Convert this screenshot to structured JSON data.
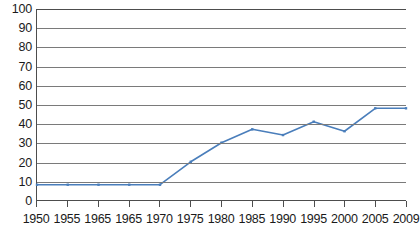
{
  "chart_data": {
    "type": "line",
    "title": "",
    "subtitle": "",
    "xlabel": "",
    "ylabel": "",
    "ylim": [
      0,
      100
    ],
    "ytick_step": 10,
    "yticks": [
      0,
      10,
      20,
      30,
      40,
      50,
      60,
      70,
      80,
      90,
      100
    ],
    "grid": true,
    "legend": false,
    "legend_position": "none",
    "categories": [
      "1950",
      "1955",
      "1965",
      "1965",
      "1970",
      "1975",
      "1980",
      "1985",
      "1990",
      "1995",
      "2000",
      "2005",
      "2009"
    ],
    "series": [
      {
        "name": "series-1",
        "color": "#4a7ebb",
        "values": [
          8,
          8,
          8,
          8,
          8,
          20,
          30,
          37,
          34,
          41,
          36,
          48,
          48
        ]
      }
    ],
    "x": [
      1950,
      1955,
      1965,
      1965,
      1970,
      1975,
      1980,
      1985,
      1990,
      1995,
      2000,
      2005,
      2009
    ]
  },
  "style": {
    "line_color": "#4a7ebb",
    "marker_color": "#4a7ebb",
    "grid_color": "#7a7a7a",
    "axis_color": "#4d4d4d",
    "text_color": "#1a1a1a",
    "background": "#ffffff"
  }
}
